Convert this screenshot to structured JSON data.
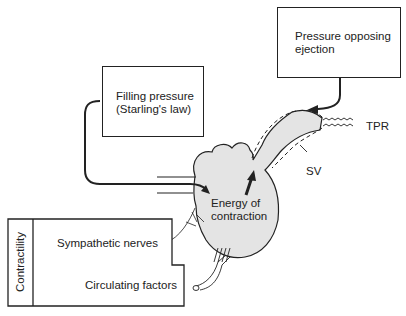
{
  "boxes": {
    "pressure_opposing": {
      "line1": "Pressure opposing",
      "line2": "ejection"
    },
    "filling_pressure": {
      "line1": "Filling pressure",
      "line2": "(Starling's law)"
    },
    "contractility": {
      "title": "Contractility",
      "item1": "Sympathetic nerves",
      "item2": "Circulating factors"
    }
  },
  "labels": {
    "tpr": "TPR",
    "sv": "SV",
    "energy_line1": "Energy of",
    "energy_line2": "contraction"
  },
  "colors": {
    "line": "#222222",
    "heart_fill": "#e4e4e4"
  }
}
